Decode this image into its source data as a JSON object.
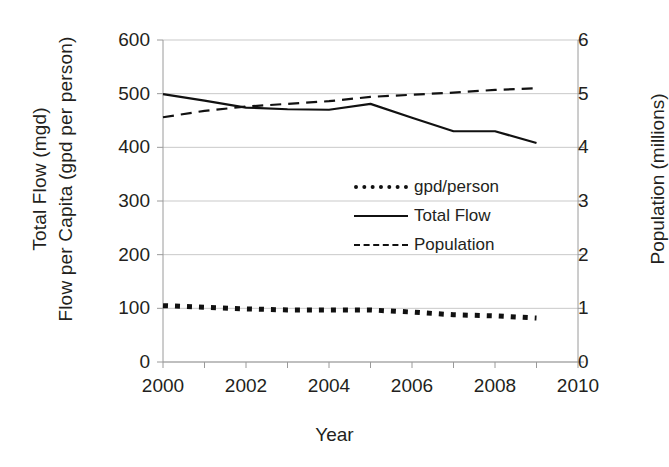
{
  "chart_data": {
    "type": "line",
    "title": "",
    "xlabel": "Year",
    "ylabel_left_line1": "Total Flow (mgd)",
    "ylabel_left_line2": "Flow per Capita (gpd per person)",
    "ylabel_right": "Population (millions)",
    "grid": true,
    "legend_position": "center",
    "xlim": [
      2000,
      2010
    ],
    "xticks": [
      2000,
      2002,
      2004,
      2006,
      2008,
      2010
    ],
    "xtick_labels": [
      "2000",
      "2002",
      "2004",
      "2006",
      "2008",
      "2010"
    ],
    "ylim_left": [
      0,
      600
    ],
    "yticks_left": [
      0,
      100,
      200,
      300,
      400,
      500,
      600
    ],
    "ytick_labels_left": [
      "0",
      "100",
      "200",
      "300",
      "400",
      "500",
      "600"
    ],
    "ylim_right": [
      0,
      6
    ],
    "yticks_right": [
      0,
      1,
      2,
      3,
      4,
      5,
      6
    ],
    "ytick_labels_right": [
      "0",
      "1",
      "2",
      "3",
      "4",
      "5",
      "6"
    ],
    "x": [
      2000,
      2001,
      2002,
      2003,
      2004,
      2005,
      2006,
      2007,
      2008,
      2009
    ],
    "series": [
      {
        "name": "gpd/person",
        "legend_label": "gpd/person",
        "axis": "left",
        "style": "dotted",
        "color": "#111111",
        "values": [
          105,
          102,
          99,
          97,
          97,
          97,
          93,
          88,
          86,
          82
        ]
      },
      {
        "name": "Total Flow",
        "legend_label": "Total Flow",
        "axis": "left",
        "style": "solid",
        "color": "#111111",
        "values": [
          499,
          487,
          474,
          471,
          470,
          481,
          455,
          430,
          430,
          408
        ]
      },
      {
        "name": "Population",
        "legend_label": "Population",
        "axis": "right",
        "style": "dashed",
        "color": "#111111",
        "values": [
          4.56,
          4.68,
          4.76,
          4.81,
          4.86,
          4.94,
          4.98,
          5.02,
          5.07,
          5.1
        ]
      }
    ]
  },
  "axes": {
    "left_title_line1": "Total Flow (mgd)",
    "left_title_line2": "Flow per Capita (gpd per person)",
    "right_title": "Population (millions)",
    "x_title": "Year"
  },
  "legend": {
    "items": [
      {
        "label": "gpd/person"
      },
      {
        "label": "Total Flow"
      },
      {
        "label": "Population"
      }
    ]
  }
}
